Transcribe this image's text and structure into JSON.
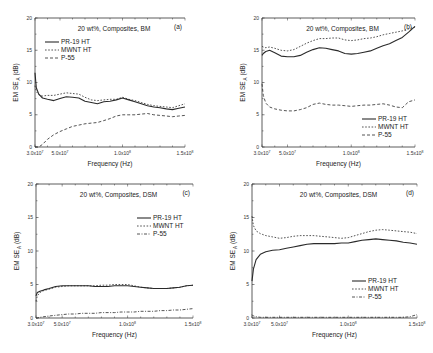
{
  "chart_data": [
    {
      "panel": "a",
      "type": "line",
      "title": "20 wt%, Composites, BM",
      "panel_label": "(a)",
      "xlabel": "Frequency (Hz)",
      "ylabel": "EM SE_A (dB)",
      "xlim": [
        30000000,
        150000000
      ],
      "ylim": [
        0,
        20
      ],
      "xticks": [
        "3.0x10⁷",
        "5.0x10⁷",
        "1.0x10⁸",
        "1.5x10⁸"
      ],
      "yticks": [
        "0",
        "5",
        "10",
        "15",
        "20"
      ],
      "legend_position": "upper-left",
      "x": [
        30,
        31,
        33,
        36,
        40,
        45,
        50,
        55,
        60,
        65,
        70,
        75,
        80,
        85,
        90,
        95,
        100,
        105,
        110,
        115,
        120,
        125,
        130,
        135,
        140,
        145,
        150
      ],
      "series": [
        {
          "name": "PR-19 HT",
          "style": "solid",
          "values": [
            11.5,
            9.2,
            8.2,
            7.6,
            7.4,
            7.2,
            7.5,
            7.8,
            7.7,
            7.6,
            7.1,
            6.9,
            6.7,
            7.0,
            7.1,
            7.3,
            7.6,
            7.3,
            7.0,
            6.7,
            6.4,
            6.2,
            6.1,
            5.9,
            5.8,
            6.0,
            6.2
          ]
        },
        {
          "name": "MWNT HT",
          "style": "dotted",
          "values": [
            9.5,
            8.6,
            8.1,
            7.9,
            8.0,
            8.0,
            8.2,
            8.4,
            8.3,
            8.2,
            7.7,
            7.3,
            7.2,
            7.3,
            7.4,
            7.4,
            7.7,
            7.4,
            7.2,
            6.9,
            6.6,
            6.4,
            6.3,
            6.2,
            6.1,
            6.4,
            6.7
          ]
        },
        {
          "name": "P-55",
          "style": "dashed",
          "values": [
            0.0,
            0.0,
            0.0,
            0.4,
            1.2,
            1.9,
            2.4,
            2.8,
            3.2,
            3.4,
            3.6,
            3.7,
            3.8,
            4.1,
            4.4,
            4.8,
            5.0,
            5.0,
            5.0,
            5.1,
            5.2,
            5.0,
            4.9,
            4.8,
            4.7,
            4.8,
            4.9
          ]
        }
      ]
    },
    {
      "panel": "b",
      "type": "line",
      "title": "20 wt%, Composites, BM",
      "panel_label": "(b)",
      "xlabel": "Frequency (Hz)",
      "ylabel": "EM SE_A (dB)",
      "xlim": [
        30000000,
        150000000
      ],
      "ylim": [
        0,
        20
      ],
      "xticks": [
        "3.0x10⁷",
        "5.0x10⁷",
        "1.0x10⁸",
        "1.5x10⁸"
      ],
      "yticks": [
        "0",
        "5",
        "10",
        "15",
        "20"
      ],
      "legend_position": "lower-right",
      "x": [
        30,
        31,
        33,
        36,
        40,
        45,
        50,
        55,
        60,
        65,
        70,
        75,
        80,
        85,
        90,
        95,
        100,
        105,
        110,
        115,
        120,
        125,
        130,
        135,
        140,
        145,
        150
      ],
      "series": [
        {
          "name": "PR-19 HT",
          "style": "solid",
          "values": [
            14.2,
            14.5,
            14.8,
            15.0,
            14.6,
            14.1,
            14.0,
            14.0,
            14.2,
            14.7,
            15.1,
            15.4,
            15.3,
            15.1,
            14.9,
            14.5,
            14.4,
            14.5,
            14.7,
            14.9,
            15.3,
            15.7,
            16.0,
            16.5,
            17.0,
            17.8,
            18.7
          ]
        },
        {
          "name": "MWNT HT",
          "style": "dotted",
          "values": [
            15.6,
            15.5,
            15.4,
            15.5,
            15.3,
            15.0,
            14.9,
            15.1,
            15.6,
            16.1,
            16.5,
            16.8,
            16.8,
            16.9,
            16.9,
            16.6,
            16.5,
            16.6,
            16.8,
            16.9,
            17.1,
            17.4,
            17.6,
            17.8,
            18.0,
            18.3,
            18.6
          ]
        },
        {
          "name": "P-55",
          "style": "dashed",
          "values": [
            9.8,
            8.0,
            6.8,
            6.2,
            5.9,
            5.7,
            5.6,
            5.6,
            5.8,
            6.1,
            6.6,
            6.8,
            6.6,
            6.5,
            6.5,
            6.4,
            6.3,
            6.4,
            6.5,
            6.5,
            6.6,
            6.7,
            6.5,
            6.2,
            6.1,
            7.0,
            7.3
          ]
        }
      ]
    },
    {
      "panel": "c",
      "type": "line",
      "title": "20 wt%, Composites, DSM",
      "panel_label": "(c)",
      "xlabel": "Frequency (Hz)",
      "ylabel": "EM SE_A (dB)",
      "xlim": [
        30000000,
        150000000
      ],
      "ylim": [
        0,
        20
      ],
      "xticks": [
        "3.0x10⁷",
        "5.0x10⁷",
        "1.0x10⁸",
        "1.5x10⁸"
      ],
      "yticks": [
        "0",
        "5",
        "10",
        "15",
        "20"
      ],
      "legend_position": "upper-right",
      "x": [
        30,
        31,
        33,
        36,
        40,
        45,
        50,
        55,
        60,
        65,
        70,
        75,
        80,
        85,
        90,
        95,
        100,
        105,
        110,
        115,
        120,
        125,
        130,
        135,
        140,
        145,
        150
      ],
      "series": [
        {
          "name": "PR-19 HT",
          "style": "solid",
          "values": [
            3.3,
            3.8,
            4.0,
            4.2,
            4.4,
            4.7,
            4.8,
            4.8,
            4.8,
            4.8,
            4.8,
            4.7,
            4.7,
            4.7,
            4.8,
            4.8,
            4.8,
            4.7,
            4.6,
            4.5,
            4.4,
            4.4,
            4.4,
            4.5,
            4.6,
            4.8,
            4.9
          ]
        },
        {
          "name": "MWNT HT",
          "style": "dotted",
          "values": [
            2.5,
            3.3,
            3.8,
            4.1,
            4.3,
            4.6,
            4.7,
            4.8,
            4.8,
            4.8,
            4.8,
            4.8,
            4.9,
            4.9,
            5.0,
            5.0,
            5.0,
            4.8,
            4.6,
            4.5,
            4.4,
            4.4,
            4.4,
            4.5,
            4.6,
            4.8,
            4.9
          ]
        },
        {
          "name": "P-55",
          "style": "dash-dot",
          "values": [
            0.0,
            0.0,
            0.1,
            0.2,
            0.3,
            0.4,
            0.5,
            0.6,
            0.6,
            0.7,
            0.7,
            0.7,
            0.8,
            0.8,
            0.8,
            0.9,
            0.9,
            0.9,
            1.0,
            1.0,
            1.0,
            1.1,
            1.1,
            1.2,
            1.2,
            1.3,
            1.4
          ]
        }
      ]
    },
    {
      "panel": "d",
      "type": "line",
      "title": "20 wt%, Composites, DSM",
      "panel_label": "(d)",
      "xlabel": "Frequency (Hz)",
      "ylabel": "EM SE_A (dB)",
      "xlim": [
        30000000,
        150000000
      ],
      "ylim": [
        0,
        20
      ],
      "xticks": [
        "3.0x10⁷",
        "5.0x10⁷",
        "1.0x10⁸",
        "1.5x10⁸"
      ],
      "yticks": [
        "0",
        "5",
        "10",
        "15",
        "20"
      ],
      "legend_position": "lower-right",
      "x": [
        30,
        31,
        33,
        36,
        40,
        45,
        50,
        55,
        60,
        65,
        70,
        75,
        80,
        85,
        90,
        95,
        100,
        105,
        110,
        115,
        120,
        125,
        130,
        135,
        140,
        145,
        150
      ],
      "series": [
        {
          "name": "PR-19 HT",
          "style": "solid",
          "values": [
            5.5,
            7.3,
            8.7,
            9.5,
            9.9,
            10.1,
            10.2,
            10.4,
            10.6,
            10.8,
            11.0,
            11.1,
            11.1,
            11.1,
            11.1,
            11.2,
            11.2,
            11.4,
            11.6,
            11.7,
            11.8,
            11.7,
            11.6,
            11.5,
            11.3,
            11.2,
            11.0
          ]
        },
        {
          "name": "MWNT HT",
          "style": "dotted",
          "values": [
            15.2,
            13.8,
            13.0,
            12.6,
            12.3,
            12.1,
            11.9,
            12.0,
            12.2,
            12.3,
            12.3,
            12.3,
            12.2,
            12.1,
            12.0,
            11.9,
            12.0,
            12.3,
            12.6,
            12.9,
            13.1,
            13.2,
            13.1,
            13.0,
            12.9,
            12.8,
            12.6
          ]
        },
        {
          "name": "P-55",
          "style": "dash-dot",
          "values": [
            0.5,
            0.3,
            0.2,
            0.1,
            0.1,
            0.1,
            0.1,
            0.1,
            0.1,
            0.1,
            0.1,
            0.1,
            0.1,
            0.1,
            0.1,
            0.1,
            0.1,
            0.1,
            0.1,
            0.1,
            0.1,
            0.1,
            0.1,
            0.1,
            0.1,
            0.2,
            0.5
          ]
        }
      ]
    }
  ],
  "panels": [
    {
      "title": "20 wt%, Composites, BM",
      "label": "(a)",
      "xlabel": "Frequency (Hz)",
      "ylabel": "EM SE",
      "ylabel_sub": "A",
      "ylabel_unit": "(dB)",
      "legend": [
        "PR-19 HT",
        "MWNT HT",
        "P-55"
      ]
    },
    {
      "title": "20 wt%, Composites, BM",
      "label": "(b)",
      "xlabel": "Frequency (Hz)",
      "ylabel": "EM SE",
      "ylabel_sub": "A",
      "ylabel_unit": "(dB)",
      "legend": [
        "PR-19 HT",
        "MWNT HT",
        "P-55"
      ]
    },
    {
      "title": "20 wt%, Composites, DSM",
      "label": "(c)",
      "xlabel": "Frequency (Hz)",
      "ylabel": "EM SE",
      "ylabel_sub": "A",
      "ylabel_unit": "(dB)",
      "legend": [
        "PR-19 HT",
        "MWNT HT",
        "P-55"
      ]
    },
    {
      "title": "20 wt%, Composites, DSM",
      "label": "(d)",
      "xlabel": "Frequency (Hz)",
      "ylabel": "EM SE",
      "ylabel_sub": "A",
      "ylabel_unit": "(dB)",
      "legend": [
        "PR-19 HT",
        "MWNT HT",
        "P-55"
      ]
    }
  ],
  "ticks": {
    "x": [
      "3.0x10",
      "5.0x10",
      "1.0x10",
      "1.5x10"
    ],
    "x_exp": [
      "7",
      "7",
      "8",
      "8"
    ],
    "y": [
      "0",
      "5",
      "10",
      "15",
      "20"
    ]
  },
  "colors": {
    "line": "#2a2a2a",
    "axis": "#333333",
    "background": "#ffffff"
  }
}
